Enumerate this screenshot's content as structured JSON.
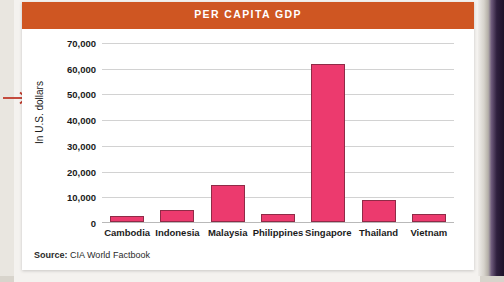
{
  "figure": {
    "title": "PER CAPITA GDP",
    "source_label": "Source:",
    "source_value": "CIA World Factbook",
    "title_bar_color": "#CF5622",
    "bar_color": "#EC3A6E"
  },
  "chart_data": {
    "type": "bar",
    "title": "PER CAPITA GDP",
    "xlabel": "",
    "ylabel": "In U.S. dollars",
    "categories": [
      "Cambodia",
      "Indonesia",
      "Malaysia",
      "Philippines",
      "Singapore",
      "Thailand",
      "Vietnam"
    ],
    "values": [
      2300,
      4700,
      14500,
      3300,
      61500,
      8700,
      3000
    ],
    "ylim": [
      0,
      70000
    ],
    "ytick_labels": [
      "70,000",
      "60,000",
      "50,000",
      "40,000",
      "30,000",
      "20,000",
      "10,000",
      "0"
    ],
    "ytick_values": [
      70000,
      60000,
      50000,
      40000,
      30000,
      20000,
      10000,
      0
    ],
    "grid": true,
    "legend": false,
    "series": [
      {
        "name": "Per capita GDP",
        "values": [
          2300,
          4700,
          14500,
          3300,
          61500,
          8700,
          3000
        ]
      }
    ]
  },
  "annotation": {
    "arrow_color": "#C0392B",
    "arrow_name": "red-arrow-annotation"
  }
}
